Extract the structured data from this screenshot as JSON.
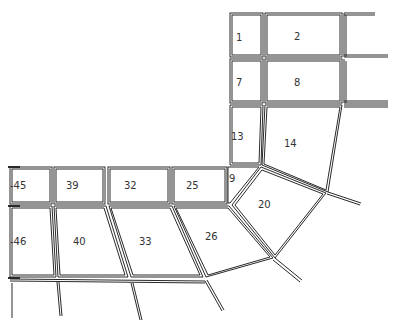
{
  "diagram": {
    "type": "finite-element-mesh",
    "elements": [
      {
        "id": "1",
        "label": "1",
        "x": 240,
        "y": 37
      },
      {
        "id": "2",
        "label": "2",
        "x": 298,
        "y": 36
      },
      {
        "id": "7",
        "label": "7",
        "x": 240,
        "y": 82
      },
      {
        "id": "8",
        "label": "8",
        "x": 298,
        "y": 82
      },
      {
        "id": "13",
        "label": "13",
        "x": 237,
        "y": 136
      },
      {
        "id": "14",
        "label": "14",
        "x": 290,
        "y": 143
      },
      {
        "id": "19",
        "label": "9",
        "x": 232,
        "y": 181
      },
      {
        "id": "20",
        "label": "20",
        "x": 264,
        "y": 205
      },
      {
        "id": "25",
        "label": "25",
        "x": 192,
        "y": 186
      },
      {
        "id": "26",
        "label": "26",
        "x": 211,
        "y": 236
      },
      {
        "id": "32",
        "label": "32",
        "x": 130,
        "y": 186
      },
      {
        "id": "33",
        "label": "33",
        "x": 145,
        "y": 243
      },
      {
        "id": "39",
        "label": "39",
        "x": 73,
        "y": 186
      },
      {
        "id": "40",
        "label": "40",
        "x": 79,
        "y": 243
      },
      {
        "id": "45",
        "label": "-45",
        "x": 14,
        "y": 186
      },
      {
        "id": "46",
        "label": "-46",
        "x": 14,
        "y": 243
      }
    ]
  }
}
